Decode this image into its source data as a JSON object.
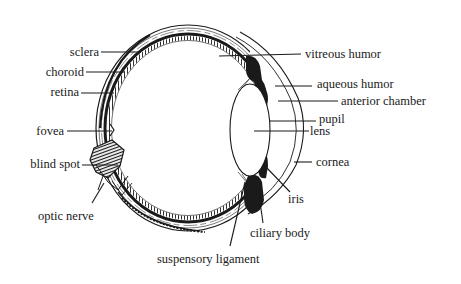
{
  "diagram": {
    "labels": {
      "sclera": "sclera",
      "choroid": "choroid",
      "retina": "retina",
      "fovea": "fovea",
      "blind_spot": "blind spot",
      "optic_nerve": "optic nerve",
      "vitreous_humor": "vitreous humor",
      "aqueous_humor": "aqueous humor",
      "anterior_chamber": "anterior chamber",
      "pupil": "pupil",
      "lens": "lens",
      "cornea": "cornea",
      "iris": "iris",
      "ciliary_body": "ciliary body",
      "suspensory_ligament": "suspensory ligament"
    },
    "colors": {
      "ink": "#1a1a1a",
      "background": "#ffffff"
    }
  }
}
